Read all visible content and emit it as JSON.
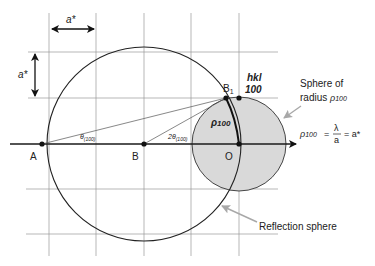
{
  "diagram": {
    "labels": {
      "a_star_horizontal": "a*",
      "a_star_vertical": "a*",
      "point_A": "A",
      "point_B": "B",
      "point_O": "O",
      "point_B1": "B",
      "point_B1_sub": "1",
      "hkl_label": "hkl",
      "hkl_value": "100",
      "theta_label": "θ",
      "theta_sub": "(100)",
      "two_theta_label": "2θ",
      "two_theta_sub": "(100)",
      "rho_label": "ρ",
      "rho_sub": "100",
      "sphere_radius_line1": "Sphere of",
      "sphere_radius_line2": "radius",
      "sphere_radius_rho": "ρ",
      "sphere_radius_rho_sub": "100",
      "equation_lhs": "ρ",
      "equation_lhs_sub": "100",
      "equation_eq1": "=",
      "equation_numerator": "λ",
      "equation_denominator": "a",
      "equation_eq2": "= a*",
      "reflection_sphere": "Reflection sphere"
    },
    "geometry": {
      "grid_vertical_x": [
        49,
        96,
        144,
        191,
        239
      ],
      "grid_horizontal_y": [
        52,
        98,
        189,
        234
      ],
      "axis_y": 144,
      "point_A": [
        42,
        144
      ],
      "point_B": [
        144,
        144
      ],
      "point_O": [
        239,
        144
      ],
      "point_B1": [
        226,
        98
      ],
      "point_hkl100": [
        239,
        98
      ],
      "reflection_sphere_radius": 97,
      "rho_sphere_radius": 47
    },
    "colors": {
      "line": "#222222",
      "grid": "#9a9a9a",
      "small_sphere_fill": "#d9d9d9",
      "pointer_arrow": "#a8a8a8"
    }
  }
}
